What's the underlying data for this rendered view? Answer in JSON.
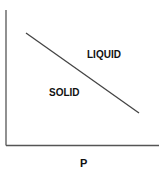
{
  "diagram": {
    "type": "phase-diagram",
    "x_axis_label": "P",
    "y_axis_label": "",
    "regions": [
      {
        "name": "liquid",
        "label": "LIQUID"
      },
      {
        "name": "solid",
        "label": "SOLID"
      }
    ],
    "boundary": {
      "description": "solid-liquid coexistence line with negative slope"
    },
    "colors": {
      "axis": "#555555",
      "line": "#444444",
      "text": "#111111"
    }
  }
}
